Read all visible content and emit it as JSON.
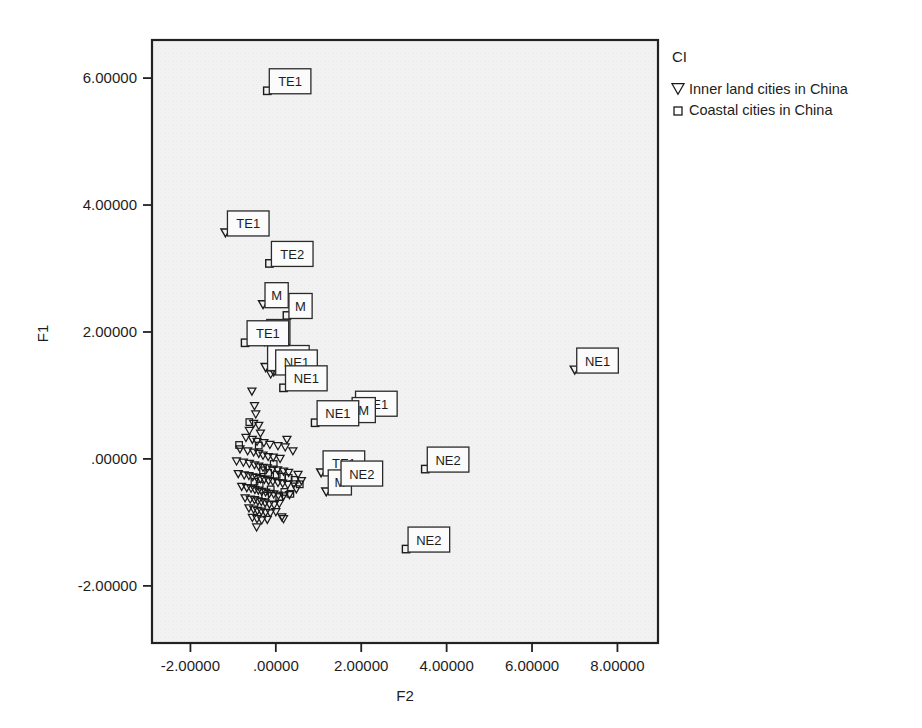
{
  "chart_data": {
    "type": "scatter",
    "title": "",
    "xlabel": "F2",
    "ylabel": "F1",
    "xlim": [
      -2.9,
      8.95
    ],
    "ylim": [
      -2.9,
      6.6
    ],
    "xticks": [
      -2,
      0,
      2,
      4,
      6,
      8
    ],
    "yticks": [
      -2,
      0,
      2,
      4,
      6
    ],
    "xticklabels": [
      "-2.00000",
      ".00000",
      "2.00000",
      "4.00000",
      "6.00000",
      "8.00000"
    ],
    "yticklabels": [
      "-2.00000",
      ".00000",
      "2.00000",
      "4.00000",
      "6.00000"
    ],
    "grid": false,
    "legend": {
      "title": "CI",
      "position": "outside-top-right",
      "entries": [
        {
          "label": "Inner land cities in China",
          "marker": "triangle-down-open",
          "key": "inner"
        },
        {
          "label": "Coastal cities in China",
          "marker": "square-open",
          "key": "coastal"
        }
      ]
    },
    "series": [
      {
        "name": "Inner land cities in China",
        "marker": "triangle-down-open",
        "points": [
          {
            "x": -1.18,
            "y": 3.56,
            "label": "TE1"
          },
          {
            "x": -0.3,
            "y": 2.43,
            "label": "M"
          },
          {
            "x": -0.26,
            "y": 1.85,
            "label": "M"
          },
          {
            "x": -0.24,
            "y": 1.44,
            "label": "TE2"
          },
          {
            "x": -0.12,
            "y": 1.33,
            "label": null
          },
          {
            "x": -0.05,
            "y": 1.37,
            "label": "NE1"
          },
          {
            "x": 1.82,
            "y": 0.72,
            "label": "TE1"
          },
          {
            "x": 1.74,
            "y": 0.62,
            "label": "M"
          },
          {
            "x": 7.0,
            "y": 1.4,
            "label": "NE1"
          },
          {
            "x": 1.06,
            "y": -0.22,
            "label": "TE1"
          },
          {
            "x": 1.18,
            "y": -0.52,
            "label": "M"
          },
          {
            "x": -0.56,
            "y": 1.06,
            "label": null
          },
          {
            "x": -0.5,
            "y": 0.83,
            "label": null
          },
          {
            "x": -0.47,
            "y": 0.7,
            "label": null
          },
          {
            "x": -0.52,
            "y": 0.55,
            "label": null
          },
          {
            "x": -0.4,
            "y": 0.52,
            "label": null
          },
          {
            "x": -0.62,
            "y": 0.44,
            "label": null
          },
          {
            "x": -0.36,
            "y": 0.4,
            "label": null
          },
          {
            "x": -0.7,
            "y": 0.33,
            "label": null
          },
          {
            "x": -0.55,
            "y": 0.3,
            "label": null
          },
          {
            "x": -0.44,
            "y": 0.27,
            "label": null
          },
          {
            "x": -0.28,
            "y": 0.25,
            "label": null
          },
          {
            "x": -0.14,
            "y": 0.22,
            "label": null
          },
          {
            "x": 0.05,
            "y": 0.2,
            "label": null
          },
          {
            "x": 0.22,
            "y": 0.18,
            "label": null
          },
          {
            "x": -0.84,
            "y": 0.15,
            "label": null
          },
          {
            "x": -0.66,
            "y": 0.12,
            "label": null
          },
          {
            "x": -0.52,
            "y": 0.1,
            "label": null
          },
          {
            "x": -0.4,
            "y": 0.08,
            "label": null
          },
          {
            "x": -0.3,
            "y": 0.05,
            "label": null
          },
          {
            "x": -0.18,
            "y": 0.03,
            "label": null
          },
          {
            "x": -0.06,
            "y": 0.02,
            "label": null
          },
          {
            "x": 0.1,
            "y": 0.0,
            "label": null
          },
          {
            "x": -0.92,
            "y": -0.04,
            "label": null
          },
          {
            "x": -0.76,
            "y": -0.06,
            "label": null
          },
          {
            "x": -0.62,
            "y": -0.08,
            "label": null
          },
          {
            "x": -0.5,
            "y": -0.1,
            "label": null
          },
          {
            "x": -0.4,
            "y": -0.12,
            "label": null
          },
          {
            "x": -0.3,
            "y": -0.14,
            "label": null
          },
          {
            "x": -0.2,
            "y": -0.15,
            "label": null
          },
          {
            "x": -0.08,
            "y": -0.17,
            "label": null
          },
          {
            "x": 0.04,
            "y": -0.18,
            "label": null
          },
          {
            "x": 0.18,
            "y": -0.2,
            "label": null
          },
          {
            "x": 0.3,
            "y": -0.22,
            "label": null
          },
          {
            "x": -0.88,
            "y": -0.24,
            "label": null
          },
          {
            "x": -0.74,
            "y": -0.26,
            "label": null
          },
          {
            "x": -0.63,
            "y": -0.27,
            "label": null
          },
          {
            "x": -0.54,
            "y": -0.29,
            "label": null
          },
          {
            "x": -0.45,
            "y": -0.3,
            "label": null
          },
          {
            "x": -0.36,
            "y": -0.32,
            "label": null
          },
          {
            "x": -0.27,
            "y": -0.33,
            "label": null
          },
          {
            "x": -0.17,
            "y": -0.35,
            "label": null
          },
          {
            "x": -0.07,
            "y": -0.36,
            "label": null
          },
          {
            "x": 0.05,
            "y": -0.38,
            "label": null
          },
          {
            "x": 0.16,
            "y": -0.39,
            "label": null
          },
          {
            "x": 0.28,
            "y": -0.41,
            "label": null
          },
          {
            "x": 0.42,
            "y": -0.4,
            "label": null
          },
          {
            "x": -0.8,
            "y": -0.44,
            "label": null
          },
          {
            "x": -0.68,
            "y": -0.46,
            "label": null
          },
          {
            "x": -0.58,
            "y": -0.47,
            "label": null
          },
          {
            "x": -0.49,
            "y": -0.49,
            "label": null
          },
          {
            "x": -0.41,
            "y": -0.5,
            "label": null
          },
          {
            "x": -0.33,
            "y": -0.52,
            "label": null
          },
          {
            "x": -0.24,
            "y": -0.53,
            "label": null
          },
          {
            "x": -0.15,
            "y": -0.55,
            "label": null
          },
          {
            "x": -0.05,
            "y": -0.56,
            "label": null
          },
          {
            "x": 0.06,
            "y": -0.58,
            "label": null
          },
          {
            "x": 0.18,
            "y": -0.59,
            "label": null
          },
          {
            "x": 0.32,
            "y": -0.57,
            "label": null
          },
          {
            "x": -0.72,
            "y": -0.62,
            "label": null
          },
          {
            "x": -0.6,
            "y": -0.64,
            "label": null
          },
          {
            "x": -0.5,
            "y": -0.65,
            "label": null
          },
          {
            "x": -0.42,
            "y": -0.67,
            "label": null
          },
          {
            "x": -0.34,
            "y": -0.68,
            "label": null
          },
          {
            "x": -0.25,
            "y": -0.7,
            "label": null
          },
          {
            "x": -0.15,
            "y": -0.72,
            "label": null
          },
          {
            "x": -0.04,
            "y": -0.73,
            "label": null
          },
          {
            "x": 0.08,
            "y": -0.71,
            "label": null
          },
          {
            "x": -0.63,
            "y": -0.78,
            "label": null
          },
          {
            "x": -0.52,
            "y": -0.8,
            "label": null
          },
          {
            "x": -0.43,
            "y": -0.82,
            "label": null
          },
          {
            "x": -0.34,
            "y": -0.83,
            "label": null
          },
          {
            "x": -0.24,
            "y": -0.85,
            "label": null
          },
          {
            "x": -0.13,
            "y": -0.86,
            "label": null
          },
          {
            "x": 0.0,
            "y": -0.84,
            "label": null
          },
          {
            "x": -0.55,
            "y": -0.93,
            "label": null
          },
          {
            "x": -0.44,
            "y": -0.95,
            "label": null
          },
          {
            "x": -0.33,
            "y": -0.97,
            "label": null
          },
          {
            "x": -0.2,
            "y": -0.96,
            "label": null
          },
          {
            "x": 0.14,
            "y": -0.92,
            "label": null
          },
          {
            "x": 0.18,
            "y": -0.95,
            "label": null
          },
          {
            "x": -0.45,
            "y": -1.08,
            "label": null
          },
          {
            "x": 0.52,
            "y": -0.25,
            "label": null
          },
          {
            "x": 0.6,
            "y": -0.35,
            "label": null
          },
          {
            "x": 0.48,
            "y": -0.48,
            "label": null
          },
          {
            "x": 0.26,
            "y": 0.3,
            "label": null
          },
          {
            "x": 0.4,
            "y": 0.12,
            "label": null
          }
        ]
      },
      {
        "name": "Coastal cities in China",
        "marker": "square-open",
        "points": [
          {
            "x": -0.2,
            "y": 5.8,
            "label": "TE1"
          },
          {
            "x": -0.15,
            "y": 3.08,
            "label": "TE2"
          },
          {
            "x": 0.26,
            "y": 2.26,
            "label": "M"
          },
          {
            "x": -0.72,
            "y": 1.83,
            "label": "TE1"
          },
          {
            "x": 0.18,
            "y": 1.12,
            "label": "NE1"
          },
          {
            "x": 0.92,
            "y": 0.57,
            "label": "NE1"
          },
          {
            "x": 3.5,
            "y": -0.16,
            "label": "NE2"
          },
          {
            "x": 1.48,
            "y": -0.38,
            "label": "NE2"
          },
          {
            "x": 3.05,
            "y": -1.42,
            "label": "NE2"
          },
          {
            "x": -0.86,
            "y": 0.22,
            "label": null
          },
          {
            "x": -0.62,
            "y": 0.58,
            "label": null
          },
          {
            "x": -0.4,
            "y": 0.21,
            "label": null
          },
          {
            "x": -0.3,
            "y": -0.18,
            "label": null
          },
          {
            "x": -0.18,
            "y": -0.22,
            "label": null
          },
          {
            "x": 0.02,
            "y": -0.25,
            "label": null
          },
          {
            "x": 0.14,
            "y": -0.28,
            "label": null
          },
          {
            "x": 0.3,
            "y": -0.3,
            "label": null
          },
          {
            "x": 0.44,
            "y": -0.33,
            "label": null
          },
          {
            "x": 0.56,
            "y": -0.4,
            "label": null
          },
          {
            "x": 0.2,
            "y": -0.52,
            "label": null
          },
          {
            "x": 0.34,
            "y": -0.55,
            "label": null
          },
          {
            "x": 0.08,
            "y": -0.6,
            "label": null
          },
          {
            "x": -0.12,
            "y": -0.48,
            "label": null
          },
          {
            "x": -0.25,
            "y": -0.58,
            "label": null
          },
          {
            "x": -0.38,
            "y": -0.42,
            "label": null
          },
          {
            "x": -0.5,
            "y": -0.36,
            "label": null
          },
          {
            "x": -0.05,
            "y": -0.08,
            "label": null
          }
        ]
      }
    ]
  }
}
